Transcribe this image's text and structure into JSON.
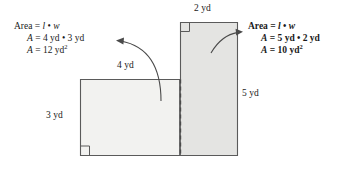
{
  "diagram": {
    "colors": {
      "stroke": "#5a5a5a",
      "fill_left": "#f2f2f0",
      "fill_right": "#e4e4e2",
      "text": "#1a1a1a",
      "arrow": "#4a4a4a",
      "background": "#ffffff"
    },
    "dimension_labels": [
      {
        "id": "top-2yd",
        "text": "2 yd"
      },
      {
        "id": "top-4yd",
        "text": "4 yd"
      },
      {
        "id": "left-3yd",
        "text": "3 yd"
      },
      {
        "id": "right-5yd",
        "text": "5 yd"
      }
    ],
    "left_annotation": {
      "formula_label": "Area",
      "equals": "=",
      "length_symbol": "l",
      "dot": "•",
      "width_symbol": "w",
      "line1_area": "Area",
      "line2_var": "A",
      "line2_value": "= 4 yd • 3 yd",
      "line3_var": "A",
      "line3_value": "= 12 yd",
      "line3_exponent": "2",
      "bold": false
    },
    "right_annotation": {
      "formula_label": "Area",
      "equals": "=",
      "length_symbol": "l",
      "dot": "•",
      "width_symbol": "w",
      "line1_area": "Area",
      "line2_var": "A",
      "line2_value": "= 5 yd • 2 yd",
      "line3_var": "A",
      "line3_value": "= 10 yd",
      "line3_exponent": "2",
      "bold": true
    },
    "shapes": [
      {
        "name": "left-rectangle",
        "x": 80,
        "y": 79,
        "width": 100,
        "height": 77,
        "length_yd": 4,
        "width_yd": 3,
        "area_yd2": 12
      },
      {
        "name": "right-rectangle",
        "x": 180,
        "y": 22,
        "width": 58,
        "height": 134,
        "length_yd": 5,
        "width_yd": 2,
        "area_yd2": 10
      }
    ],
    "divider": {
      "name": "dashed-divider",
      "x": 180,
      "y1": 79,
      "y2": 156
    },
    "right_angle_markers": [
      {
        "name": "right-angle-bottom-left",
        "x": 80,
        "y": 156
      },
      {
        "name": "right-angle-top-right-rect",
        "x": 180,
        "y": 22
      }
    ],
    "arrows": [
      {
        "name": "left-callout-arrow",
        "from_x": 161,
        "from_y": 101,
        "to_x": 118,
        "to_y": 41
      },
      {
        "name": "right-callout-arrow",
        "from_x": 211,
        "from_y": 53,
        "to_x": 241,
        "to_y": 32
      }
    ]
  }
}
